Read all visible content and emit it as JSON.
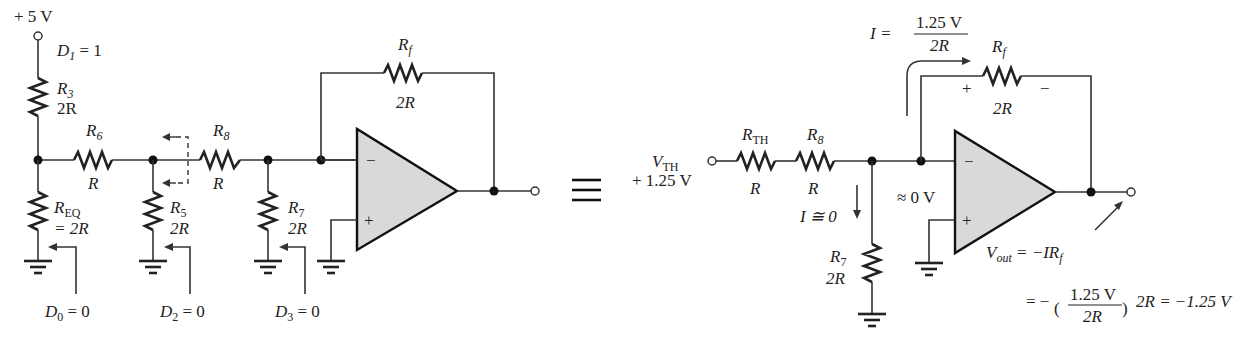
{
  "left_circuit": {
    "supply": "+ 5 V",
    "d1": {
      "letter": "D",
      "sub": "1",
      "rest": " = 1"
    },
    "r3": {
      "name": "R",
      "sub": "3",
      "value": "2R"
    },
    "r6": {
      "name": "R",
      "sub": "6",
      "value": "R"
    },
    "r8": {
      "name": "R",
      "sub": "8",
      "value": "R"
    },
    "req": {
      "name": "R",
      "sub": "EQ",
      "value": "= 2R"
    },
    "r5": {
      "name": "R",
      "sub": "5",
      "value": "2R"
    },
    "r7": {
      "name": "R",
      "sub": "7",
      "value": "2R"
    },
    "rf": {
      "name": "R",
      "sub": "f",
      "value": "2R"
    },
    "d0": {
      "letter": "D",
      "sub": "0",
      "rest": " = 0"
    },
    "d2": {
      "letter": "D",
      "sub": "2",
      "rest": " = 0"
    },
    "d3": {
      "letter": "D",
      "sub": "3",
      "rest": " = 0"
    },
    "minus": "−",
    "plus": "+"
  },
  "equivalence_symbol": "≡",
  "right_circuit": {
    "vth": {
      "name": "V",
      "sub": "TH",
      "value": "+ 1.25 V"
    },
    "rth": {
      "name": "R",
      "sub": "TH",
      "value": "R"
    },
    "r8": {
      "name": "R",
      "sub": "8",
      "value": "R"
    },
    "r7": {
      "name": "R",
      "sub": "7",
      "value": "2R"
    },
    "rf": {
      "name": "R",
      "sub": "f",
      "value": "2R",
      "plus": "+",
      "minus": "−"
    },
    "current_eq": {
      "lhs": "I =",
      "num": "1.25 V",
      "den": "2R"
    },
    "i_zero": "I ≅ 0",
    "virtual_ground": "≈ 0 V",
    "vout_eq1": {
      "v": "V",
      "sub": "out",
      "rest": " = −IR",
      "fsub": "f"
    },
    "vout_eq2": {
      "eq": "= −",
      "num": "1.25 V",
      "den": "2R",
      "rest": "2R = −1.25 V"
    },
    "minus": "−",
    "plus": "+"
  }
}
